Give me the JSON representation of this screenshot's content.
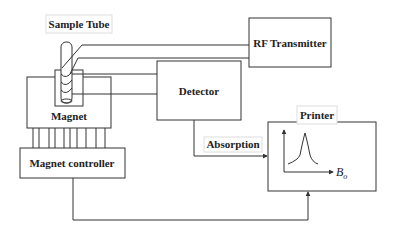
{
  "components": {
    "sample_tube": {
      "label": "Sample Tube"
    },
    "magnet": {
      "label": "Magnet"
    },
    "magnet_controller": {
      "label": "Magnet controller"
    },
    "rf_transmitter": {
      "label": "RF Transmitter"
    },
    "detector": {
      "label": "Detector"
    },
    "printer": {
      "label": "Printer"
    }
  },
  "signals": {
    "absorption": {
      "label": "Absorption"
    }
  },
  "printer_plot": {
    "x_axis_label": "B",
    "x_axis_subscript": "o",
    "shape": "single-peak"
  },
  "colors": {
    "line": "#333333",
    "background": "#ffffff",
    "label_border": "#dddddd"
  }
}
